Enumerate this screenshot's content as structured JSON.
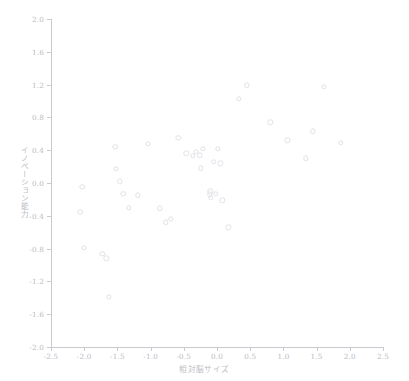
{
  "chart_data": {
    "type": "scatter",
    "title": "",
    "xlabel": "相対脳サイズ",
    "ylabel": "イノベーション能力",
    "xlim": [
      -2.5,
      2.5
    ],
    "ylim": [
      -2.0,
      2.0
    ],
    "xticks": [
      -2.5,
      -2.0,
      -1.5,
      -1.0,
      -0.5,
      0.0,
      0.5,
      1.0,
      1.5,
      2.0,
      2.5
    ],
    "xtick_labels": [
      "-2.5",
      "-2.0",
      "-1.5",
      "-1.0",
      "-0.5",
      "0.0",
      "0.5",
      "1.0",
      "1.5",
      "2.0",
      "2.5"
    ],
    "yticks": [
      -2.0,
      -1.6,
      -1.2,
      -0.8,
      -0.4,
      0.0,
      0.4,
      0.8,
      1.2,
      1.6,
      2.0
    ],
    "ytick_labels": [
      "-2.0",
      "-1.6",
      "-1.2",
      "-0.8",
      "-0.4",
      "0.0",
      "0.4",
      "0.8",
      "1.2",
      "1.6",
      "2.0"
    ],
    "grid": false,
    "legend": null,
    "marker": "open-circle",
    "marker_color": "#e2e2e8",
    "axis_color": "#c9c9cf",
    "tick_label_color": "#b9b9c0",
    "axis_title_color": "#bcbcc3",
    "background_color": "#ffffff",
    "n_points": 40,
    "points": [
      {
        "x": -2.03,
        "y": -0.05
      },
      {
        "x": -2.06,
        "y": -0.35
      },
      {
        "x": -2.01,
        "y": -0.79
      },
      {
        "x": -1.73,
        "y": -0.86
      },
      {
        "x": -1.67,
        "y": -0.92
      },
      {
        "x": -1.63,
        "y": -1.39
      },
      {
        "x": -1.53,
        "y": 0.44
      },
      {
        "x": -1.52,
        "y": 0.17
      },
      {
        "x": -1.46,
        "y": 0.02
      },
      {
        "x": -1.41,
        "y": -0.13
      },
      {
        "x": -1.33,
        "y": -0.3
      },
      {
        "x": -1.19,
        "y": -0.15
      },
      {
        "x": -1.04,
        "y": 0.48
      },
      {
        "x": -0.86,
        "y": -0.31
      },
      {
        "x": -0.77,
        "y": -0.48
      },
      {
        "x": -0.7,
        "y": -0.44
      },
      {
        "x": -0.58,
        "y": 0.55
      },
      {
        "x": -0.36,
        "y": 0.33
      },
      {
        "x": -0.32,
        "y": 0.38
      },
      {
        "x": -0.26,
        "y": 0.34
      },
      {
        "x": -0.24,
        "y": 0.18
      },
      {
        "x": -0.21,
        "y": 0.42
      },
      {
        "x": -0.11,
        "y": -0.14
      },
      {
        "x": -0.1,
        "y": -0.1
      },
      {
        "x": -0.09,
        "y": -0.18
      },
      {
        "x": -0.05,
        "y": 0.26
      },
      {
        "x": 0.01,
        "y": 0.42
      },
      {
        "x": 0.05,
        "y": 0.24
      },
      {
        "x": 0.08,
        "y": -0.21
      },
      {
        "x": 0.17,
        "y": -0.54
      },
      {
        "x": 0.33,
        "y": 1.03
      },
      {
        "x": 0.45,
        "y": 1.19
      },
      {
        "x": 0.8,
        "y": 0.74
      },
      {
        "x": 1.06,
        "y": 0.52
      },
      {
        "x": 1.34,
        "y": 0.3
      },
      {
        "x": 1.44,
        "y": 0.63
      },
      {
        "x": 1.61,
        "y": 1.17
      },
      {
        "x": 1.86,
        "y": 0.49
      },
      {
        "x": -0.46,
        "y": 0.36
      },
      {
        "x": -0.02,
        "y": -0.13
      }
    ]
  }
}
